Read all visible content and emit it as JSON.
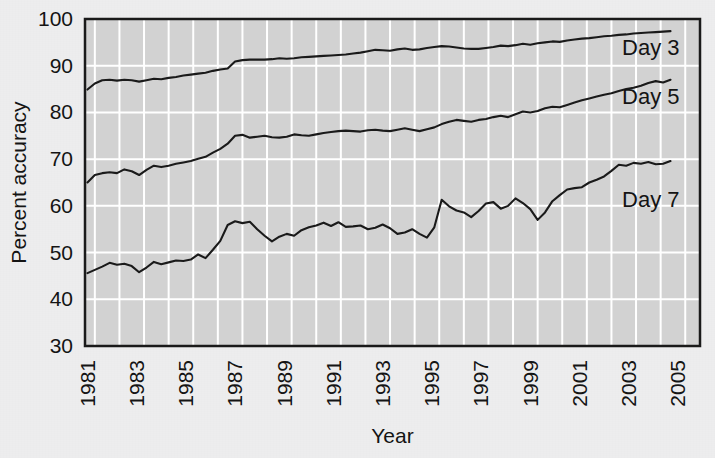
{
  "figure": {
    "background_color": "#ededee",
    "plot_background_color": "#d2d2d2",
    "gridline_color": "#ffffff",
    "axis_color": "#1a1a1a",
    "line_color": "#1a1a1a"
  },
  "chart_data": {
    "type": "line",
    "title": "",
    "xlabel": "Year",
    "ylabel": "Percent accuracy",
    "xlim": [
      1980.6,
      2005.6
    ],
    "ylim": [
      30,
      100
    ],
    "yticks": [
      30,
      40,
      50,
      60,
      70,
      80,
      90,
      100
    ],
    "xticks": [
      1981,
      1983,
      1985,
      1987,
      1989,
      1991,
      1993,
      1995,
      1997,
      1999,
      2001,
      2003,
      2005
    ],
    "xtick_labels": [
      "1981",
      "1983",
      "1985",
      "1987",
      "1989",
      "1991",
      "1993",
      "1995",
      "1997",
      "1999",
      "2001",
      "2003",
      "2005"
    ],
    "ytick_labels": [
      "30",
      "40",
      "50",
      "60",
      "70",
      "80",
      "90",
      "100"
    ],
    "grid": "both",
    "grid_x_interval": 1,
    "grid_y_interval": 10,
    "legend_position": "inline-right",
    "xtick_label_rotation": -90,
    "x": [
      1980.7,
      1981.0,
      1981.3,
      1981.6,
      1981.9,
      1982.2,
      1982.5,
      1982.8,
      1983.1,
      1983.4,
      1983.7,
      1984.0,
      1984.3,
      1984.6,
      1984.9,
      1985.2,
      1985.5,
      1985.8,
      1986.1,
      1986.4,
      1986.7,
      1987.0,
      1987.3,
      1987.6,
      1987.9,
      1988.2,
      1988.5,
      1988.8,
      1989.1,
      1989.4,
      1989.7,
      1990.0,
      1990.3,
      1990.6,
      1990.9,
      1991.2,
      1991.5,
      1991.8,
      1992.1,
      1992.4,
      1992.7,
      1993.0,
      1993.3,
      1993.6,
      1993.9,
      1994.2,
      1994.5,
      1994.8,
      1995.1,
      1995.4,
      1995.7,
      1996.0,
      1996.3,
      1996.6,
      1996.9,
      1997.2,
      1997.5,
      1997.8,
      1998.1,
      1998.4,
      1998.7,
      1999.0,
      1999.3,
      1999.6,
      1999.9,
      2000.2,
      2000.5,
      2000.8,
      2001.1,
      2001.4,
      2001.7,
      2002.0,
      2002.3,
      2002.6,
      2002.9,
      2003.2,
      2003.5,
      2003.8,
      2004.1,
      2004.4
    ],
    "series": [
      {
        "name": "Day 3",
        "label": "Day 3",
        "label_x": 2003.6,
        "label_y": 94.0,
        "values": [
          84.9,
          86.2,
          86.9,
          87.0,
          86.8,
          87.0,
          86.9,
          86.6,
          86.9,
          87.2,
          87.1,
          87.4,
          87.6,
          87.9,
          88.1,
          88.3,
          88.5,
          88.9,
          89.2,
          89.4,
          90.9,
          91.2,
          91.3,
          91.3,
          91.3,
          91.4,
          91.6,
          91.5,
          91.6,
          91.8,
          91.9,
          92.0,
          92.1,
          92.2,
          92.3,
          92.4,
          92.6,
          92.8,
          93.1,
          93.4,
          93.3,
          93.2,
          93.5,
          93.7,
          93.4,
          93.5,
          93.8,
          94.0,
          94.2,
          94.1,
          93.9,
          93.7,
          93.6,
          93.6,
          93.8,
          94.0,
          94.3,
          94.2,
          94.4,
          94.7,
          94.5,
          94.8,
          95.0,
          95.2,
          95.1,
          95.4,
          95.6,
          95.8,
          95.9,
          96.1,
          96.3,
          96.4,
          96.6,
          96.7,
          96.9,
          97.0,
          97.1,
          97.2,
          97.3,
          97.4
        ]
      },
      {
        "name": "Day 5",
        "label": "Day 5",
        "label_x": 2003.6,
        "label_y": 83.5,
        "values": [
          65.0,
          66.6,
          67.0,
          67.2,
          67.0,
          67.8,
          67.4,
          66.6,
          67.7,
          68.6,
          68.3,
          68.6,
          69.0,
          69.3,
          69.6,
          70.1,
          70.5,
          71.4,
          72.2,
          73.3,
          75.0,
          75.2,
          74.6,
          74.8,
          75.0,
          74.7,
          74.6,
          74.8,
          75.3,
          75.1,
          75.0,
          75.3,
          75.6,
          75.8,
          76.0,
          76.1,
          76.0,
          75.9,
          76.2,
          76.3,
          76.1,
          76.0,
          76.3,
          76.6,
          76.3,
          76.0,
          76.4,
          76.8,
          77.5,
          78.0,
          78.4,
          78.2,
          78.0,
          78.4,
          78.6,
          79.0,
          79.3,
          79.0,
          79.6,
          80.2,
          80.0,
          80.3,
          80.9,
          81.2,
          81.1,
          81.6,
          82.1,
          82.6,
          83.0,
          83.4,
          83.8,
          84.1,
          84.6,
          85.0,
          85.3,
          85.7,
          86.3,
          86.7,
          86.4,
          87.0
        ]
      },
      {
        "name": "Day 7",
        "label": "Day 7",
        "label_x": 2003.6,
        "label_y": 61.5,
        "values": [
          45.6,
          46.3,
          47.0,
          47.8,
          47.4,
          47.6,
          47.1,
          45.8,
          46.8,
          48.0,
          47.5,
          47.9,
          48.3,
          48.2,
          48.5,
          49.6,
          48.8,
          50.6,
          52.5,
          55.9,
          56.7,
          56.3,
          56.6,
          55.0,
          53.6,
          52.4,
          53.4,
          54.0,
          53.6,
          54.8,
          55.4,
          55.8,
          56.4,
          55.7,
          56.5,
          55.5,
          55.6,
          55.8,
          55.0,
          55.3,
          56.0,
          55.2,
          54.0,
          54.3,
          55.0,
          54.0,
          53.2,
          55.4,
          61.3,
          59.9,
          59.0,
          58.6,
          57.6,
          58.9,
          60.5,
          60.8,
          59.4,
          60.0,
          61.6,
          60.6,
          59.3,
          57.0,
          58.6,
          61.0,
          62.3,
          63.5,
          63.8,
          64.0,
          65.0,
          65.6,
          66.3,
          67.5,
          68.8,
          68.6,
          69.2,
          69.0,
          69.4,
          68.9,
          69.0,
          69.6
        ]
      }
    ]
  }
}
